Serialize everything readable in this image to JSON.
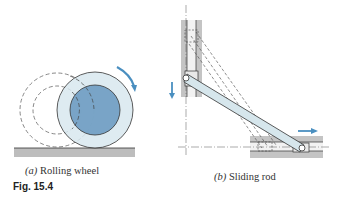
{
  "figure": {
    "label": "Fig. 15.4",
    "panels": [
      {
        "id": "a",
        "letter": "(a)",
        "title": "Rolling wheel"
      },
      {
        "id": "b",
        "letter": "(b)",
        "title": "Sliding rod"
      }
    ]
  },
  "colors": {
    "wheel_hub": "#6e9cc2",
    "wheel_rim": "#d8e8ef",
    "ground": "#b9b9b9",
    "guide": "#c4c4c4",
    "rod": "#d6e6ec",
    "arrow": "#4a8fc0",
    "line": "#333333"
  }
}
